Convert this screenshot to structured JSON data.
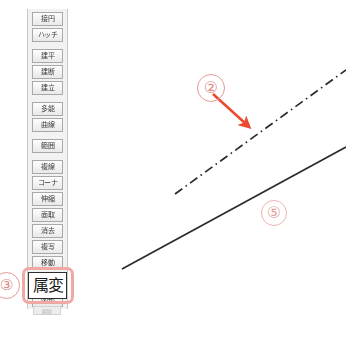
{
  "canvas": {
    "background": "#ffffff",
    "annotation_color": "#e09a96",
    "arrow_color": "#ea4a30",
    "line_color": "#2b2b2b"
  },
  "toolbar": {
    "name": "cad-command-toolbar",
    "groups": [
      {
        "name": "shape-group",
        "buttons": [
          {
            "label": "接円"
          },
          {
            "label": "ハッチ"
          }
        ]
      },
      {
        "name": "construct-group",
        "buttons": [
          {
            "label": "建平"
          },
          {
            "label": "建断"
          },
          {
            "label": "建立"
          }
        ]
      },
      {
        "name": "curve-group",
        "buttons": [
          {
            "label": "多能"
          },
          {
            "label": "曲線"
          }
        ]
      },
      {
        "name": "edit-group",
        "buttons": [
          {
            "label": "範囲"
          }
        ]
      },
      {
        "name": "modify-group",
        "buttons": [
          {
            "label": "複線"
          },
          {
            "label": "コーナ"
          },
          {
            "label": "伸縮"
          },
          {
            "label": "面取"
          },
          {
            "label": "消去"
          },
          {
            "label": "複写"
          },
          {
            "label": "移動"
          },
          {
            "label": "戻る"
          }
        ]
      },
      {
        "name": "misc-group",
        "buttons": [
          {
            "label": "図形"
          }
        ]
      }
    ],
    "highlighted_button": {
      "name": "attribute-change-button",
      "label": "属変"
    },
    "footer_label": "属取"
  },
  "annotations": [
    {
      "id": "marker-3",
      "label": "③",
      "target": "attribute-change-button"
    },
    {
      "id": "marker-2",
      "label": "②",
      "target": "dash-dot-line"
    },
    {
      "id": "marker-5",
      "label": "⑤",
      "target": "solid-line"
    }
  ],
  "drawing": {
    "dash_dot_line": {
      "name": "dash-dot-line",
      "x1": 175,
      "y1": 194,
      "x2": 346,
      "y2": 70,
      "style": "dash-dot",
      "color": "#2b2b2b",
      "width": 1.6
    },
    "solid_line": {
      "name": "solid-line",
      "x1": 122,
      "y1": 269,
      "x2": 346,
      "y2": 147,
      "style": "solid",
      "color": "#2b2b2b",
      "width": 1.6
    },
    "arrow": {
      "name": "annotation-arrow-2",
      "x1": 214,
      "y1": 95,
      "x2": 249,
      "y2": 127,
      "color": "#ea4a30"
    }
  }
}
